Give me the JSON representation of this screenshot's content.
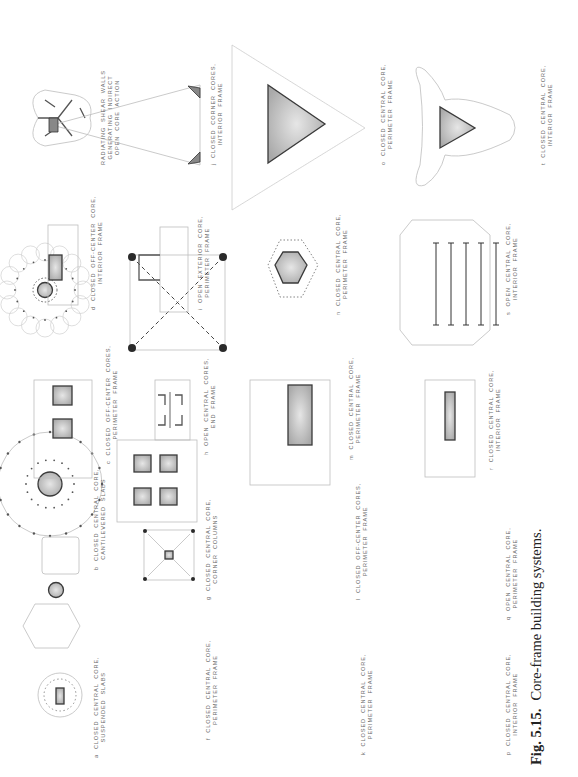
{
  "figure": {
    "number": "Fig. 5.15.",
    "title": "Core-frame building systems.",
    "orientation": "rotated 90° counter-clockwise",
    "diagrams": [
      {
        "id": "a",
        "line1": "a  CLOSED  CENTRAL  CORE,",
        "line2": "SUSPENDED  SLABS"
      },
      {
        "id": "b",
        "line1": "b  CLOSED  CENTRAL  CORE,",
        "line2": "CANTILEVERED  SLABS"
      },
      {
        "id": "c",
        "line1": "c  CLOSED  OFF-CENTER  CORES,",
        "line2": "PERIMETER  FRAME"
      },
      {
        "id": "d",
        "line1": "d  CLOSED  OFF-CENTER  CORE,",
        "line2": "INTERIOR  FRAME"
      },
      {
        "id": "e",
        "line1": "RADIATING  SHEAR  WALLS",
        "line2": "GENERATING  INDIRECT",
        "line3": "OPEN  CORE  ACTION"
      },
      {
        "id": "f",
        "line1": "f  CLOSED  CENTRAL  CORE,",
        "line2": "PERIMETER  FRAME"
      },
      {
        "id": "g",
        "line1": "g  CLOSED  CENTRAL  CORE,",
        "line2": "CORNER  COLUMNS"
      },
      {
        "id": "h",
        "line1": "h  OPEN  CENTRAL  CORES,",
        "line2": "END  FRAME"
      },
      {
        "id": "i",
        "line1": "i  OPEN  EXTERIOR  CORE,",
        "line2": "PERIMETER  FRAME"
      },
      {
        "id": "j",
        "line1": "j  CLOSED  CORNER  CORES,",
        "line2": "INTERIOR  FRAME"
      },
      {
        "id": "k",
        "line1": "k  CLOSED  CENTRAL  CORE,",
        "line2": "PERIMETER  FRAME"
      },
      {
        "id": "l",
        "line1": "l  CLOSED  OFF-CENTER  CORES,",
        "line2": "PERIMETER  FRAME"
      },
      {
        "id": "m",
        "line1": "m  CLOSED  CENTRAL  CORE,",
        "line2": "PERIMETER  FRAME"
      },
      {
        "id": "n",
        "line1": "n  CLOSED  CENTRAL  CORE,",
        "line2": "PERIMETER  FRAME"
      },
      {
        "id": "o",
        "line1": "o  CLOSED  CENTRAL  CORE,",
        "line2": "PERIMETER  FRAME"
      },
      {
        "id": "p",
        "line1": "p  CLOSED  CENTRAL  CORE,",
        "line2": "INTERIOR  FRAME"
      },
      {
        "id": "q",
        "line1": "q  OPEN  CENTRAL  CORE,",
        "line2": "PERIMETER  FRAME"
      },
      {
        "id": "r",
        "line1": "r  CLOSED  CENTRAL  CORE,",
        "line2": "INTERIOR  FRAME"
      },
      {
        "id": "s",
        "line1": "s  OPEN  CENTRAL  CORE,",
        "line2": "INTERIOR  FRAME"
      },
      {
        "id": "t",
        "line1": "t  CLOSED  CENTRAL  CORE,",
        "line2": "INTERIOR  FRAME"
      }
    ],
    "scale_label": "SCALE"
  }
}
